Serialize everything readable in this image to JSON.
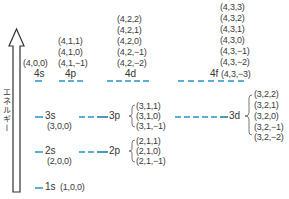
{
  "axis": {
    "label": "エネルギー",
    "direction": "up"
  },
  "colors": {
    "level_line": "#5aaed8",
    "text": "#333333"
  },
  "levels": {
    "n4": {
      "s": {
        "name": "4s",
        "numbers": [
          "(4,0,0)"
        ]
      },
      "p": {
        "name": "4p",
        "numbers": [
          "(4,1,1)",
          "(4,1,0)",
          "(4,1,−1)"
        ]
      },
      "d": {
        "name": "4d",
        "numbers": [
          "(4,2,2)",
          "(4,2,1)",
          "(4,2,0)",
          "(4,2,−1)",
          "(4,2,−2)"
        ]
      },
      "f": {
        "name": "4f",
        "numbers": [
          "(4,3,3)",
          "(4,3,2)",
          "(4,3,1)",
          "(4,3,0)",
          "(4,3,−1)",
          "(4,3,−2)",
          "(4,3,−3)"
        ]
      }
    },
    "n3": {
      "s": {
        "name": "3s",
        "numbers": [
          "(3,0,0)"
        ]
      },
      "p": {
        "name": "3p",
        "numbers": [
          "(3,1,1)",
          "(3,1,0)",
          "(3,1,−1)"
        ]
      },
      "d": {
        "name": "3d",
        "numbers": [
          "(3,2,2)",
          "(3,2,1)",
          "(3,2,0)",
          "(3,2,−1)",
          "(3,2,−2)"
        ]
      }
    },
    "n2": {
      "s": {
        "name": "2s",
        "numbers": [
          "(2,0,0)"
        ]
      },
      "p": {
        "name": "2p",
        "numbers": [
          "(2,1,1)",
          "(2,1,0)",
          "(2,1,−1)"
        ]
      }
    },
    "n1": {
      "s": {
        "name": "1s",
        "numbers": [
          "(1,0,0)"
        ]
      }
    }
  }
}
